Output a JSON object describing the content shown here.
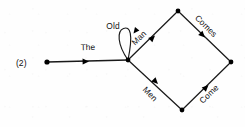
{
  "figure": {
    "number_label": "(2)",
    "type": "word-lattice-transition-diagram",
    "width": 245,
    "height": 127,
    "ink_color": "#1a1a1a",
    "background_color": "#fefefe"
  },
  "nodes": [
    {
      "id": "start",
      "name": "start-node",
      "x": 47,
      "y": 62
    },
    {
      "id": "branch",
      "name": "branch-node",
      "x": 128,
      "y": 60
    },
    {
      "id": "top",
      "name": "top-node",
      "x": 178,
      "y": 11
    },
    {
      "id": "bottom",
      "name": "bottom-node",
      "x": 182,
      "y": 110
    },
    {
      "id": "end",
      "name": "end-node",
      "x": 231,
      "y": 62
    }
  ],
  "edges": [
    {
      "id": "the",
      "label": "The",
      "from": "start",
      "to": "branch",
      "label_x": 88,
      "label_y": 50,
      "label_rotation": -1,
      "arrow_x": 89,
      "arrow_y": 61.4,
      "arrow_rotation": 358.6
    },
    {
      "id": "old",
      "label": "Old",
      "from": "branch",
      "to": "branch",
      "self_loop": true,
      "label_x": 113,
      "label_y": 29,
      "label_rotation": 0,
      "arrow_x": 133.5,
      "arrow_y": 33.5,
      "arrow_rotation": 128
    },
    {
      "id": "man",
      "label": "Man",
      "from": "branch",
      "to": "top",
      "label_x": 141,
      "label_y": 40,
      "label_rotation": -44,
      "arrow_x": 155,
      "arrow_y": 35.5,
      "arrow_rotation": 315.5
    },
    {
      "id": "comes",
      "label": "Comes",
      "from": "top",
      "to": "end",
      "label_x": 204,
      "label_y": 28,
      "label_rotation": 45,
      "arrow_x": 205,
      "arrow_y": 37.5,
      "arrow_rotation": 45
    },
    {
      "id": "men",
      "label": "Men",
      "from": "branch",
      "to": "bottom",
      "label_x": 148,
      "label_y": 96,
      "label_rotation": 46,
      "arrow_x": 158,
      "arrow_y": 84,
      "arrow_rotation": 45.6
    },
    {
      "id": "come",
      "label": "Come",
      "from": "bottom",
      "to": "end",
      "label_x": 211,
      "label_y": 96,
      "label_rotation": -44,
      "arrow_x": 208.5,
      "arrow_y": 85,
      "arrow_rotation": 315.5
    }
  ]
}
